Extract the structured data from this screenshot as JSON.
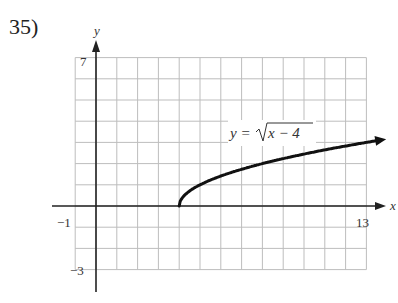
{
  "problem": {
    "number": "35)"
  },
  "chart_data": {
    "type": "line",
    "title": "",
    "equation_label": "y = √(x − 4)",
    "equation_parts": {
      "lhs": "y =",
      "radicand": "x − 4"
    },
    "xlabel": "x",
    "ylabel": "y",
    "xlim": [
      -1,
      13
    ],
    "ylim": [
      -3,
      7
    ],
    "grid": true,
    "grid_step": 1,
    "tick_labels": {
      "x_min": "−1",
      "x_max": "13",
      "y_max": "7",
      "y_min": "−3"
    },
    "series": [
      {
        "name": "y = sqrt(x - 4)",
        "start_point": [
          4,
          0
        ],
        "end_arrow": true,
        "x": [
          4,
          4.25,
          5,
          6,
          7,
          8,
          9,
          10,
          11,
          12,
          13.7
        ],
        "values": [
          0,
          0.5,
          1,
          1.41,
          1.73,
          2,
          2.24,
          2.45,
          2.65,
          2.83,
          3.1
        ]
      }
    ]
  }
}
